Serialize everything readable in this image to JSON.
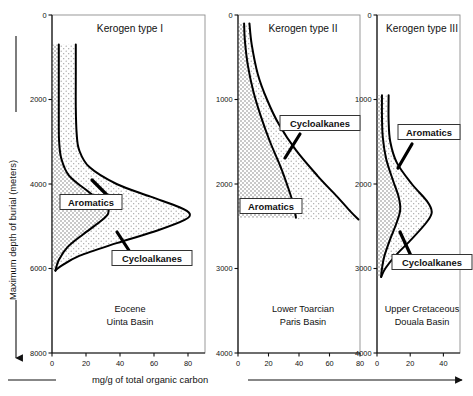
{
  "figure": {
    "axis_titles": {
      "y": "Maximum depth of burial (meters)",
      "x": "mg/g of total organic carbon"
    },
    "series_labels": {
      "aromatics": "Aromatics",
      "cycloalkanes": "Cycloalkanes"
    }
  },
  "chart_data": {
    "type": "line",
    "title": "",
    "xlabel": "mg/g of total organic carbon",
    "ylabel": "Maximum depth of burial (meters)",
    "grid": false,
    "legend": "inline-annotations",
    "y_axis_direction": "inverted-depth",
    "panels": [
      {
        "title": "Kerogen type I",
        "basin_line1": "Eocene",
        "basin_line2": "Uinta Basin",
        "xlim": [
          0,
          90
        ],
        "ylim": [
          0,
          8000
        ],
        "xticks": [
          0,
          20,
          40,
          60,
          80
        ],
        "yticks": [
          0,
          2000,
          4000,
          6000,
          8000
        ],
        "series": [
          {
            "name": "Aromatics",
            "comment": "inner/left curve: depth(m) -> mg/g",
            "points": [
              [
                700,
                4.0
              ],
              [
                1200,
                4.0
              ],
              [
                2000,
                4.0
              ],
              [
                2600,
                4.0
              ],
              [
                3000,
                4.2
              ],
              [
                3400,
                5.5
              ],
              [
                3800,
                10.0
              ],
              [
                4200,
                22.0
              ],
              [
                4500,
                32.0
              ],
              [
                4700,
                33.0
              ],
              [
                4900,
                28.0
              ],
              [
                5200,
                18.0
              ],
              [
                5500,
                9.0
              ],
              [
                5800,
                4.0
              ],
              [
                6050,
                2.0
              ]
            ]
          },
          {
            "name": "Cycloalkanes",
            "comment": "outer/right curve: depth(m) -> mg/g",
            "points": [
              [
                700,
                14.0
              ],
              [
                1400,
                14.0
              ],
              [
                2200,
                14.0
              ],
              [
                2800,
                14.5
              ],
              [
                3200,
                16.0
              ],
              [
                3600,
                22.0
              ],
              [
                4000,
                38.0
              ],
              [
                4300,
                58.0
              ],
              [
                4550,
                75.0
              ],
              [
                4700,
                81.0
              ],
              [
                4850,
                78.0
              ],
              [
                5100,
                62.0
              ],
              [
                5400,
                38.0
              ],
              [
                5700,
                16.0
              ],
              [
                5950,
                5.0
              ],
              [
                6050,
                2.0
              ]
            ]
          }
        ]
      },
      {
        "title": "Kerogen type II",
        "basin_line1": "Lower Toarcian",
        "basin_line2": "Paris Basin",
        "xlim": [
          0,
          80
        ],
        "ylim": [
          0,
          4000
        ],
        "xticks": [
          0,
          20,
          40,
          60,
          80
        ],
        "yticks": [
          0,
          1000,
          2000,
          3000,
          4000
        ],
        "series": [
          {
            "name": "Aromatics",
            "comment": "left curve ending near 2400 m",
            "points": [
              [
                100,
                4.0
              ],
              [
                300,
                4.5
              ],
              [
                600,
                6.5
              ],
              [
                900,
                10.0
              ],
              [
                1200,
                15.0
              ],
              [
                1500,
                21.0
              ],
              [
                1800,
                28.0
              ],
              [
                2050,
                33.0
              ],
              [
                2250,
                36.5
              ],
              [
                2400,
                38.0
              ]
            ]
          },
          {
            "name": "Cycloalkanes",
            "comment": "right curve, crosses the other, ends near 2400 m",
            "points": [
              [
                100,
                7.5
              ],
              [
                350,
                9.0
              ],
              [
                700,
                13.0
              ],
              [
                1000,
                19.0
              ],
              [
                1300,
                27.0
              ],
              [
                1600,
                38.0
              ],
              [
                1900,
                52.0
              ],
              [
                2150,
                65.0
              ],
              [
                2330,
                74.0
              ],
              [
                2420,
                79.0
              ]
            ]
          }
        ]
      },
      {
        "title": "Kerogen type III",
        "basin_line1": "Upper Cretaceous",
        "basin_line2": "Douala Basin",
        "xlim": [
          0,
          50
        ],
        "ylim": [
          0,
          4000
        ],
        "xticks": [
          0,
          20,
          40
        ],
        "yticks": [
          0,
          1000,
          2000,
          3000,
          4000
        ],
        "series": [
          {
            "name": "Aromatics",
            "comment": "left curve with a small bulge then return",
            "points": [
              [
                950,
                3.0
              ],
              [
                1200,
                3.0
              ],
              [
                1450,
                3.5
              ],
              [
                1700,
                5.5
              ],
              [
                1950,
                9.5
              ],
              [
                2150,
                13.0
              ],
              [
                2300,
                14.0
              ],
              [
                2450,
                12.0
              ],
              [
                2650,
                8.0
              ],
              [
                2850,
                4.5
              ],
              [
                3000,
                3.0
              ],
              [
                3100,
                2.5
              ]
            ]
          },
          {
            "name": "Cycloalkanes",
            "comment": "right curve with a larger bulge",
            "points": [
              [
                950,
                7.0
              ],
              [
                1250,
                7.0
              ],
              [
                1500,
                8.0
              ],
              [
                1750,
                12.0
              ],
              [
                2000,
                21.0
              ],
              [
                2200,
                30.0
              ],
              [
                2330,
                33.0
              ],
              [
                2450,
                30.0
              ],
              [
                2650,
                21.0
              ],
              [
                2850,
                11.0
              ],
              [
                3000,
                5.0
              ],
              [
                3100,
                2.5
              ]
            ]
          }
        ]
      }
    ]
  }
}
